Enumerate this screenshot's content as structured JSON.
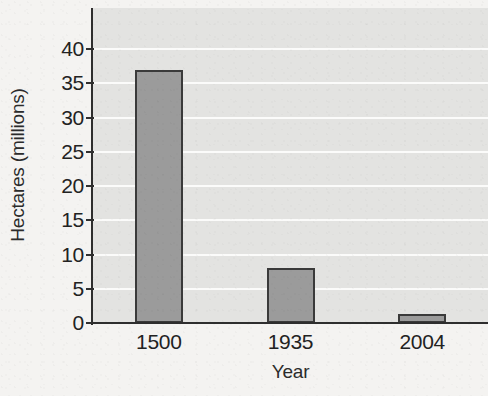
{
  "chart_data": {
    "type": "bar",
    "title": "",
    "xlabel": "Year",
    "ylabel": "Hectares (millions)",
    "categories": [
      "1500",
      "1935",
      "2004"
    ],
    "values": [
      37,
      8,
      1.3
    ],
    "series": [
      {
        "name": "Hectares (millions)",
        "values": [
          37,
          8,
          1.3
        ]
      }
    ],
    "ylim": [
      0,
      46
    ],
    "y_ticks": [
      0,
      5,
      10,
      15,
      20,
      25,
      30,
      35,
      40
    ],
    "y_tick_labels": [
      "0",
      "5",
      "10",
      "15",
      "20",
      "25",
      "30",
      "35",
      "40"
    ],
    "grid": true,
    "grid_orientation": "horizontal",
    "legend": false,
    "legend_position": "none",
    "bar_color": "#9b9b9b",
    "bar_edge_color": "#3a3a3a",
    "plot_background": "#e3e3e1",
    "gridline_color": "#fbfbfa",
    "figure_background": "#f4f3f1",
    "axis_color": "#2e2e2e",
    "text_color": "#222222"
  }
}
